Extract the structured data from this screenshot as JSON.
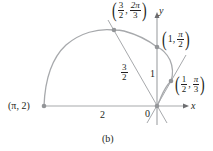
{
  "figure": {
    "caption": "(b)",
    "colors": {
      "curve": "#a7a9ac",
      "axes": "#a7a9ac",
      "lines": "#a7a9ac",
      "points": "#939598",
      "text": "#231f20"
    },
    "axes": {
      "x_label": "x",
      "y_label": "y",
      "origin_label": "0"
    },
    "curve": {
      "equation": "r = 1 - cos θ",
      "range": "0 ≤ θ ≤ π"
    },
    "points": [
      {
        "label": "(π, 2)",
        "r": "2",
        "theta": "π"
      },
      {
        "label_r_num": "3",
        "label_r_den": "2",
        "label_t_num": "2π",
        "label_t_den": "3",
        "r": "3/2",
        "theta": "2π/3"
      },
      {
        "label_r": "1",
        "label_t_num": "π",
        "label_t_den": "2",
        "r": "1",
        "theta": "π/2"
      },
      {
        "label_r_num": "1",
        "label_r_den": "2",
        "label_t_num": "π",
        "label_t_den": "3",
        "r": "1/2",
        "theta": "π/3"
      }
    ],
    "segment_labels": {
      "two": "2",
      "three_halves_num": "3",
      "three_halves_den": "2",
      "one": "1"
    },
    "separator": ","
  }
}
